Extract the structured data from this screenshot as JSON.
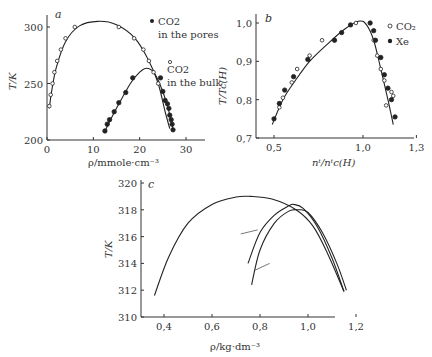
{
  "chart_data": [
    {
      "panel": "a",
      "type": "scatter",
      "xlabel": "ρ/mmole·cm⁻³",
      "ylabel": "T/K",
      "xlim": [
        0,
        35
      ],
      "ylim": [
        200,
        310
      ],
      "xticks": [
        0,
        10,
        20,
        30
      ],
      "yticks": [
        200,
        250,
        300
      ],
      "legend": [
        {
          "marker": "filled",
          "label": "CO2 in the pores"
        },
        {
          "marker": "open",
          "label": "CO2 in the bulk"
        }
      ],
      "series": [
        {
          "name": "CO2 in the bulk",
          "marker": "open",
          "points": [
            [
              0.5,
              230
            ],
            [
              0.8,
              240
            ],
            [
              1.2,
              250
            ],
            [
              1.6,
              260
            ],
            [
              2.2,
              270
            ],
            [
              3,
              280
            ],
            [
              4,
              290
            ],
            [
              6,
              300
            ],
            [
              15.5,
              300
            ],
            [
              18.8,
              290
            ],
            [
              20.8,
              280
            ],
            [
              22,
              270
            ],
            [
              23,
              260
            ],
            [
              24,
              250
            ]
          ]
        },
        {
          "name": "CO2 in the pores",
          "marker": "filled",
          "points": [
            [
              12.5,
              208
            ],
            [
              13,
              214
            ],
            [
              13.5,
              218
            ],
            [
              14.5,
              225
            ],
            [
              15.5,
              233
            ],
            [
              17,
              242
            ],
            [
              18.5,
              255
            ],
            [
              24.5,
              255
            ],
            [
              25,
              243
            ],
            [
              25.5,
              235
            ],
            [
              26,
              232
            ],
            [
              26.3,
              228
            ],
            [
              26.5,
              222
            ],
            [
              26.8,
              218
            ],
            [
              27,
              214
            ],
            [
              27.2,
              209
            ]
          ]
        }
      ],
      "curves": [
        {
          "name": "bulk fit",
          "points": [
            [
              0.5,
              228
            ],
            [
              1,
              243
            ],
            [
              2,
              264
            ],
            [
              4,
              287
            ],
            [
              7,
              301
            ],
            [
              11,
              305
            ],
            [
              15,
              302
            ],
            [
              19,
              290
            ],
            [
              22,
              270
            ],
            [
              24,
              250
            ],
            [
              25.5,
              225
            ],
            [
              26.5,
              210
            ]
          ]
        },
        {
          "name": "pores fit",
          "points": [
            [
              12.5,
              208
            ],
            [
              15,
              228
            ],
            [
              18,
              250
            ],
            [
              20,
              260
            ],
            [
              21.5,
              263.5
            ],
            [
              23,
              260
            ],
            [
              24.5,
              248
            ],
            [
              26,
              230
            ],
            [
              27.3,
              208
            ]
          ]
        }
      ]
    },
    {
      "panel": "b",
      "type": "scatter",
      "xlabel": "nᵗ/nᵗc(H)",
      "ylabel": "T/Tc(H)",
      "xlim": [
        0.4,
        1.3
      ],
      "ylim": [
        0.7,
        1.02
      ],
      "xticks": [
        0.5,
        1.0,
        1.3
      ],
      "yticks": [
        0.7,
        0.8,
        0.9,
        1.0
      ],
      "legend": [
        {
          "marker": "open",
          "label": "CO₂"
        },
        {
          "marker": "filled",
          "label": "Xe"
        }
      ],
      "series": [
        {
          "name": "CO2",
          "marker": "open",
          "points": [
            [
              0.53,
              0.78
            ],
            [
              0.55,
              0.805
            ],
            [
              0.6,
              0.845
            ],
            [
              0.63,
              0.88
            ],
            [
              0.7,
              0.915
            ],
            [
              0.77,
              0.955
            ],
            [
              0.96,
              1.0
            ],
            [
              1.06,
              0.955
            ],
            [
              1.08,
              0.915
            ],
            [
              1.1,
              0.88
            ],
            [
              1.12,
              0.85
            ],
            [
              1.13,
              0.785
            ],
            [
              1.16,
              0.82
            ],
            [
              1.17,
              0.81
            ]
          ]
        },
        {
          "name": "Xe",
          "marker": "filled",
          "points": [
            [
              0.5,
              0.75
            ],
            [
              0.53,
              0.79
            ],
            [
              0.56,
              0.825
            ],
            [
              0.61,
              0.86
            ],
            [
              0.69,
              0.905
            ],
            [
              0.84,
              0.955
            ],
            [
              0.88,
              0.975
            ],
            [
              0.93,
              0.995
            ],
            [
              1.04,
              1.0
            ],
            [
              1.06,
              0.98
            ],
            [
              1.07,
              0.955
            ],
            [
              1.1,
              0.91
            ],
            [
              1.12,
              0.865
            ],
            [
              1.14,
              0.83
            ],
            [
              1.16,
              0.8
            ],
            [
              1.18,
              0.755
            ]
          ]
        }
      ],
      "curves": [
        {
          "name": "fit",
          "points": [
            [
              0.49,
              0.735
            ],
            [
              0.55,
              0.8
            ],
            [
              0.62,
              0.85
            ],
            [
              0.7,
              0.9
            ],
            [
              0.8,
              0.945
            ],
            [
              0.9,
              0.985
            ],
            [
              0.98,
              1.005
            ],
            [
              1.02,
              0.995
            ],
            [
              1.06,
              0.955
            ],
            [
              1.1,
              0.88
            ],
            [
              1.14,
              0.8
            ],
            [
              1.17,
              0.735
            ]
          ]
        }
      ]
    },
    {
      "panel": "c",
      "type": "line",
      "xlabel": "ρ/kg·dm⁻³",
      "ylabel": "T/K",
      "xlim": [
        0.3,
        1.2
      ],
      "ylim": [
        310,
        320
      ],
      "xticks": [
        0.4,
        0.6,
        0.8,
        1.0,
        1.2
      ],
      "yticks": [
        310,
        312,
        314,
        316,
        318,
        320
      ],
      "series": [
        {
          "name": "curve 1",
          "points": [
            [
              0.36,
              311.6
            ],
            [
              0.42,
              314.5
            ],
            [
              0.5,
              317
            ],
            [
              0.6,
              318.4
            ],
            [
              0.7,
              318.95
            ],
            [
              0.76,
              319
            ],
            [
              0.85,
              318.8
            ],
            [
              0.95,
              318
            ],
            [
              1.02,
              316.8
            ],
            [
              1.08,
              314.8
            ],
            [
              1.15,
              311.9
            ]
          ]
        },
        {
          "name": "curve 2",
          "points": [
            [
              0.75,
              314
            ],
            [
              0.8,
              316.3
            ],
            [
              0.86,
              317.6
            ],
            [
              0.92,
              318.3
            ],
            [
              0.94,
              318.4
            ],
            [
              0.98,
              318.1
            ],
            [
              1.04,
              316.7
            ],
            [
              1.1,
              314.4
            ],
            [
              1.15,
              311.9
            ]
          ]
        },
        {
          "name": "curve 3",
          "points": [
            [
              0.765,
              312.4
            ],
            [
              0.8,
              315
            ],
            [
              0.86,
              317
            ],
            [
              0.92,
              317.9
            ],
            [
              0.96,
              318
            ],
            [
              1.0,
              317.8
            ],
            [
              1.06,
              316.3
            ],
            [
              1.12,
              314
            ],
            [
              1.16,
              312
            ]
          ]
        }
      ],
      "annotations": [
        {
          "type": "tick-mark",
          "from": [
            0.72,
            316.2
          ],
          "to": [
            0.79,
            316.5
          ]
        },
        {
          "type": "tick-mark",
          "from": [
            0.78,
            313.5
          ],
          "to": [
            0.84,
            314
          ]
        }
      ]
    }
  ],
  "panels": {
    "a": {
      "letter": "a",
      "xlabel": "ρ/mmole·cm⁻³",
      "ylabel": "T/K",
      "legend_pores_1": "CO2",
      "legend_pores_2": "in the pores",
      "legend_bulk_1": "CO2",
      "legend_bulk_2": "in the bulk"
    },
    "b": {
      "letter": "b",
      "xlabel": "nᵗ/nᵗc(H)",
      "ylabel": "T/Tc(H)",
      "legend_co2": "CO₂",
      "legend_xe": "Xe"
    },
    "c": {
      "letter": "c",
      "xlabel": "ρ/kg·dm⁻³",
      "ylabel": "T/K"
    }
  }
}
